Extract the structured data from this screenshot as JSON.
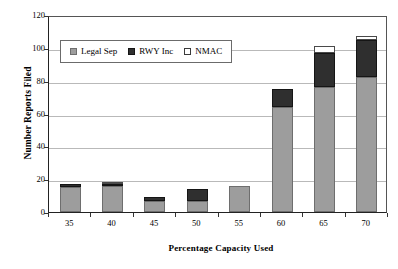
{
  "chart_data": {
    "type": "bar",
    "stacked": true,
    "title": "",
    "xlabel": "Percentage Capacity Used",
    "ylabel": "Number Reports Filed",
    "categories": [
      "35",
      "40",
      "45",
      "50",
      "55",
      "60",
      "65",
      "70"
    ],
    "series": [
      {
        "name": "Legal Sep",
        "color": "#9d9d9d",
        "values": [
          15,
          16,
          7,
          7,
          16,
          64,
          76,
          82
        ]
      },
      {
        "name": "RWY Inc",
        "color": "#2f2f2f",
        "values": [
          2,
          1,
          2,
          7,
          0,
          11,
          21,
          23
        ]
      },
      {
        "name": "NMAC",
        "color": "#ffffff",
        "values": [
          0,
          1,
          0,
          0,
          0,
          0,
          4,
          2
        ]
      }
    ],
    "totals": [
      17,
      18,
      9,
      14,
      16,
      75,
      101,
      107
    ],
    "ylim": [
      0,
      120
    ],
    "yticks": [
      "0",
      "20",
      "40",
      "60",
      "80",
      "100",
      "120"
    ],
    "ytick_values": [
      0,
      20,
      40,
      60,
      80,
      100,
      120
    ],
    "grid": true,
    "legend_position": "upper-left-inside"
  },
  "axes": {
    "y_title": "Number Reports Filed",
    "x_title": "Percentage Capacity Used"
  },
  "legend": {
    "items": [
      {
        "label": "Legal Sep",
        "swatch": "square-gray"
      },
      {
        "label": "RWY Inc",
        "swatch": "square-black"
      },
      {
        "label": "NMAC",
        "swatch": "square-white"
      }
    ]
  }
}
